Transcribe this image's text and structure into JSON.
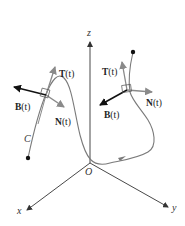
{
  "figure": {
    "axes": {
      "z_label": "z",
      "x_label": "x",
      "y_label": "y",
      "origin_label": "O"
    },
    "curve_label": "C",
    "frame_left": {
      "T_label": "T",
      "N_label": "N",
      "B_label": "B",
      "param": "(t)"
    },
    "frame_right": {
      "T_label": "T",
      "N_label": "N",
      "B_label": "B",
      "param": "(t)"
    },
    "colors": {
      "axis": "#333333",
      "curve": "#7a7a7a",
      "tangent_arrow": "#888888",
      "normal_arrow": "#888888",
      "binormal_arrow": "#111111",
      "text": "#222222"
    }
  }
}
